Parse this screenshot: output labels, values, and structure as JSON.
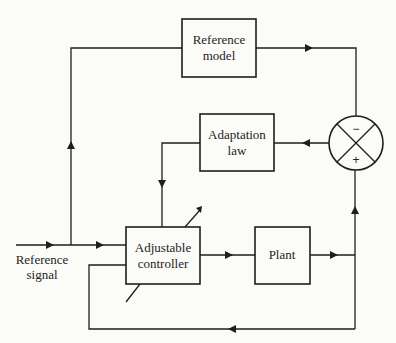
{
  "diagram": {
    "blocks": {
      "reference_model": {
        "line1": "Reference",
        "line2": "model"
      },
      "adaptation_law": {
        "line1": "Adaptation",
        "line2": "law"
      },
      "adjustable_controller": {
        "line1": "Adjustable",
        "line2": "controller"
      },
      "plant": {
        "label": "Plant"
      }
    },
    "summing_junction": {
      "top_sign": "−",
      "bottom_sign": "+"
    },
    "input": {
      "line1": "Reference",
      "line2": "signal"
    }
  }
}
